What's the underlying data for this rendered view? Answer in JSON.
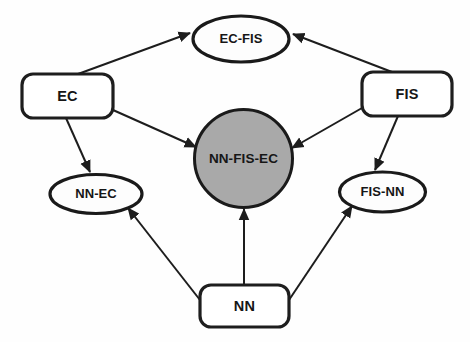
{
  "diagram": {
    "type": "directed-graph",
    "canvas": {
      "width": 470,
      "height": 342
    },
    "colors": {
      "background": "#fefefe",
      "node_stroke": "#1a1a1a",
      "node_fill_plain": "#ffffff",
      "node_fill_highlight": "#a9a9a9",
      "edge": "#1d1d1d",
      "text": "#161616"
    },
    "nodes": [
      {
        "id": "ec",
        "label": "EC",
        "shape": "rounded-rect",
        "fill": "#ffffff",
        "cx": 67.5,
        "cy": 96,
        "w": 91,
        "h": 44,
        "r": 11
      },
      {
        "id": "fis",
        "label": "FIS",
        "shape": "rounded-rect",
        "fill": "#ffffff",
        "cx": 407,
        "cy": 94,
        "w": 90,
        "h": 44,
        "r": 11
      },
      {
        "id": "nn",
        "label": "NN",
        "shape": "rounded-rect",
        "fill": "#ffffff",
        "cx": 244.5,
        "cy": 306,
        "w": 89,
        "h": 42,
        "r": 11
      },
      {
        "id": "ec-fis",
        "label": "EC-FIS",
        "shape": "ellipse",
        "fill": "#fdfdfd",
        "cx": 241,
        "cy": 39,
        "rx": 48,
        "ry": 23
      },
      {
        "id": "nn-ec",
        "label": "NN-EC",
        "shape": "ellipse",
        "fill": "#fdfdfd",
        "cx": 96,
        "cy": 194,
        "rx": 46,
        "ry": 19.5
      },
      {
        "id": "fis-nn",
        "label": "FIS-NN",
        "shape": "ellipse",
        "fill": "#fdfdfd",
        "cx": 382.5,
        "cy": 192,
        "rx": 43,
        "ry": 20
      },
      {
        "id": "nn-fis-ec",
        "label": "NN-FIS-EC",
        "shape": "circle",
        "fill": "#a9a9a9",
        "cx": 243.5,
        "cy": 158.5,
        "r": 49
      }
    ],
    "edges": [
      {
        "id": "ec-to-ecfis",
        "from": "ec",
        "to": "ec-fis",
        "x1": 78,
        "y1": 74,
        "x2": 190,
        "y2": 33
      },
      {
        "id": "fis-to-ecfis",
        "from": "fis",
        "to": "ec-fis",
        "x1": 392,
        "y1": 72,
        "x2": 293,
        "y2": 34
      },
      {
        "id": "ec-to-core",
        "from": "ec",
        "to": "nn-fis-ec",
        "x1": 113,
        "y1": 110,
        "x2": 196,
        "y2": 147
      },
      {
        "id": "fis-to-core",
        "from": "fis",
        "to": "nn-fis-ec",
        "x1": 362,
        "y1": 108,
        "x2": 292,
        "y2": 148
      },
      {
        "id": "ec-to-nnec",
        "from": "ec",
        "to": "nn-ec",
        "x1": 66,
        "y1": 118,
        "x2": 90,
        "y2": 172
      },
      {
        "id": "fis-to-fisnn",
        "from": "fis",
        "to": "fis-nn",
        "x1": 398,
        "y1": 116,
        "x2": 375,
        "y2": 170
      },
      {
        "id": "nn-to-core",
        "from": "nn",
        "to": "nn-fis-ec",
        "x1": 244,
        "y1": 285,
        "x2": 244,
        "y2": 209
      },
      {
        "id": "nn-to-nnec",
        "from": "nn",
        "to": "nn-ec",
        "x1": 200,
        "y1": 300,
        "x2": 128,
        "y2": 208
      },
      {
        "id": "nn-to-fisnn",
        "from": "nn",
        "to": "fis-nn",
        "x1": 289,
        "y1": 300,
        "x2": 352,
        "y2": 206
      }
    ]
  }
}
